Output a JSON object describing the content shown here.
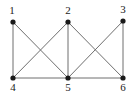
{
  "diagram": {
    "type": "graph",
    "nodes": [
      {
        "id": "1",
        "label": "1",
        "x": 13,
        "y": 22,
        "label_x": 12,
        "label_y": 14
      },
      {
        "id": "2",
        "label": "2",
        "x": 68,
        "y": 22,
        "label_x": 68,
        "label_y": 14
      },
      {
        "id": "3",
        "label": "3",
        "x": 123,
        "y": 21,
        "label_x": 123,
        "label_y": 13
      },
      {
        "id": "4",
        "label": "4",
        "x": 13,
        "y": 78,
        "label_x": 13,
        "label_y": 91
      },
      {
        "id": "5",
        "label": "5",
        "x": 68,
        "y": 78,
        "label_x": 68,
        "label_y": 91
      },
      {
        "id": "6",
        "label": "6",
        "x": 123,
        "y": 78,
        "label_x": 123,
        "label_y": 91
      }
    ],
    "edges": [
      {
        "from": "1",
        "to": "4"
      },
      {
        "from": "1",
        "to": "5"
      },
      {
        "from": "2",
        "to": "4"
      },
      {
        "from": "2",
        "to": "5"
      },
      {
        "from": "2",
        "to": "6"
      },
      {
        "from": "3",
        "to": "5"
      },
      {
        "from": "3",
        "to": "6"
      },
      {
        "from": "4",
        "to": "5"
      },
      {
        "from": "5",
        "to": "6"
      }
    ],
    "colors": {
      "edge": "#6e6e6e",
      "node": "#1a1a1a",
      "label": "#222222",
      "background": "#ffffff"
    }
  }
}
